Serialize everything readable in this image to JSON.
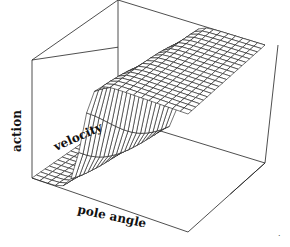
{
  "chart_data": {
    "type": "surface",
    "title": "",
    "axes": {
      "x": {
        "label": "pole angle"
      },
      "y": {
        "label": "velocity"
      },
      "z": {
        "label": "action"
      }
    },
    "grid": {
      "rows": 20,
      "cols": 20
    },
    "surface": {
      "low_value": 0,
      "high_value": 1,
      "transition_center_fraction": 0.38,
      "transition_sharpness": 30,
      "velocity_skew": 0.12
    },
    "ink_color": "#1a1a1a",
    "background_color": "#ffffff"
  },
  "labels": {
    "z_axis": "action",
    "y_axis": "velocity",
    "x_axis": "pole angle",
    "corner_mark": "·"
  }
}
